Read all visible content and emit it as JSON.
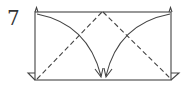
{
  "diagram": {
    "step_number": "7",
    "type": "origami-fold-step",
    "colors": {
      "stroke": "#444444",
      "background": "#ffffff"
    },
    "elements": [
      "paper-rectangle",
      "valley-fold-line-left (dashed)",
      "valley-fold-line-right (dashed)",
      "fold-arrow-left",
      "fold-arrow-right",
      "corner-flaps"
    ]
  }
}
